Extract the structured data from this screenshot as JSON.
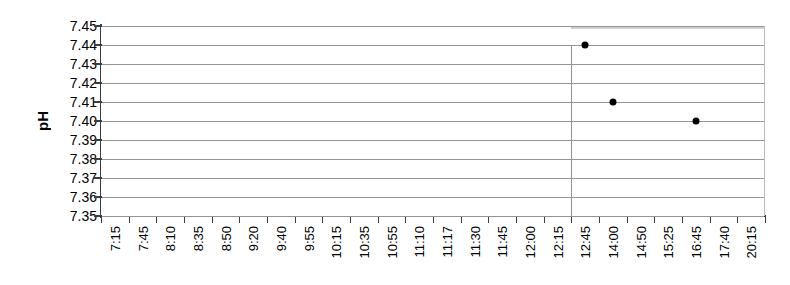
{
  "chart_data": {
    "type": "scatter",
    "title": "",
    "xlabel": "",
    "ylabel": "pH",
    "ylim": [
      7.35,
      7.45
    ],
    "ytick_step": 0.01,
    "grid": true,
    "legend": "none",
    "categories": [
      "7:15",
      "7:45",
      "8:10",
      "8:35",
      "8:50",
      "9:20",
      "9:40",
      "9:55",
      "10:15",
      "10:35",
      "10:55",
      "11:10",
      "11:17",
      "11:30",
      "11:45",
      "12:00",
      "12:15",
      "12:45",
      "14:00",
      "14:50",
      "15:25",
      "16:45",
      "17:40",
      "20:15"
    ],
    "yticks": [
      "7.45",
      "7.44",
      "7.43",
      "7.42",
      "7.41",
      "7.40",
      "7.39",
      "7.38",
      "7.37",
      "7.36",
      "7.35"
    ],
    "ytick_values": [
      7.45,
      7.44,
      7.43,
      7.42,
      7.41,
      7.4,
      7.39,
      7.38,
      7.37,
      7.36,
      7.35
    ],
    "series": [
      {
        "name": "pH",
        "marker": "filled-circle",
        "color": "#000000",
        "points": [
          {
            "x": "12:45",
            "x_index": 17,
            "y": 7.44
          },
          {
            "x": "14:00",
            "x_index": 18,
            "y": 7.41
          },
          {
            "x": "16:45",
            "x_index": 21,
            "y": 7.4
          }
        ]
      }
    ],
    "annotations": [
      {
        "name": "vertical-divider",
        "type": "vline",
        "x_index": 17,
        "color": "#909090",
        "from_y": 7.44,
        "to_y": 7.35
      },
      {
        "name": "top-gray-band",
        "type": "hline",
        "color": "#c8c8c8",
        "y": 7.4495,
        "from_x_index": 17,
        "to_x_index": 23
      }
    ]
  },
  "axis": {
    "y_title": "pH"
  }
}
